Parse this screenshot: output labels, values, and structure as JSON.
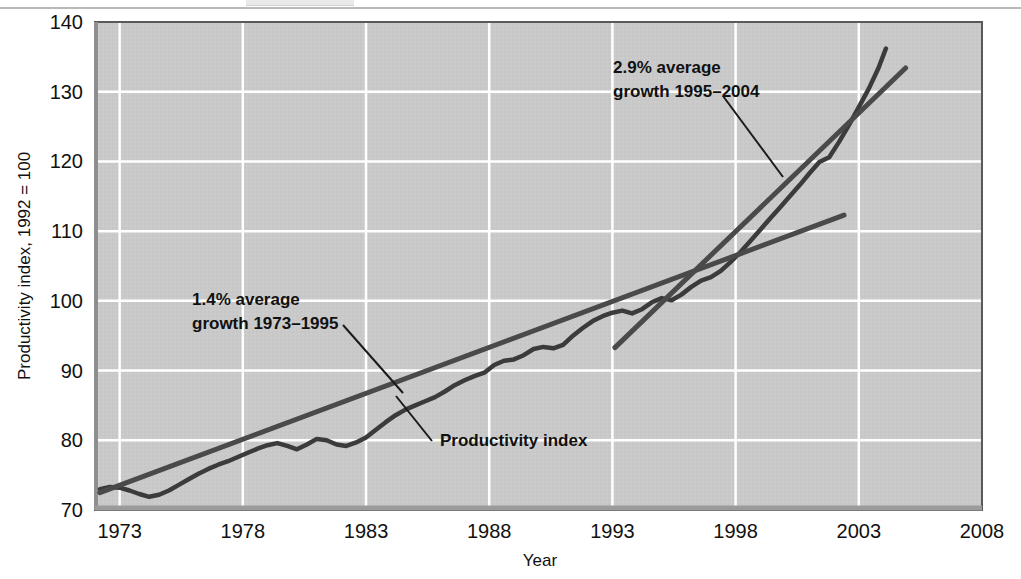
{
  "chart_data": {
    "type": "line",
    "title": "",
    "xlabel": "Year",
    "ylabel": "Productivity index, 1992 = 100",
    "xlim": [
      1972,
      2008
    ],
    "ylim": [
      70,
      140
    ],
    "xticks": [
      "1973",
      "1978",
      "1983",
      "1988",
      "1993",
      "1998",
      "2003",
      "2008"
    ],
    "xtick_values": [
      1973,
      1978,
      1983,
      1988,
      1993,
      1998,
      2003,
      2008
    ],
    "yticks": [
      "70",
      "80",
      "90",
      "100",
      "110",
      "120",
      "130",
      "140"
    ],
    "ytick_values": [
      70,
      80,
      90,
      100,
      110,
      120,
      130,
      140
    ],
    "grid": true,
    "legend_position": "none",
    "plot_bgcolor": "#c9c9c9",
    "gridcolor": "#ffffff",
    "linecolor": "#3b3b3b",
    "trendcolor": "#4a4a4a",
    "series": [
      {
        "name": "Productivity index",
        "type": "line",
        "x": [
          1972.2,
          1972.6,
          1973.0,
          1973.4,
          1973.8,
          1974.2,
          1974.6,
          1975.0,
          1975.4,
          1975.8,
          1976.2,
          1976.6,
          1977.0,
          1977.4,
          1977.8,
          1978.2,
          1978.6,
          1979.0,
          1979.4,
          1979.8,
          1980.2,
          1980.6,
          1981.0,
          1981.4,
          1981.8,
          1982.2,
          1982.6,
          1983.0,
          1983.4,
          1983.8,
          1984.2,
          1984.6,
          1985.0,
          1985.4,
          1985.8,
          1986.2,
          1986.6,
          1987.0,
          1987.4,
          1987.8,
          1988.2,
          1988.6,
          1989.0,
          1989.4,
          1989.8,
          1990.2,
          1990.6,
          1991.0,
          1991.4,
          1991.8,
          1992.2,
          1992.6,
          1993.0,
          1993.4,
          1993.8,
          1994.2,
          1994.6,
          1995.0,
          1995.4,
          1995.8,
          1996.2,
          1996.6,
          1997.0,
          1997.4,
          1997.8,
          1998.2,
          1998.6,
          1999.0,
          1999.4,
          1999.8,
          2000.2,
          2000.6,
          2001.0,
          2001.4,
          2001.8,
          2002.2,
          2002.6,
          2003.0,
          2003.4,
          2003.8,
          2004.1
        ],
        "y": [
          73.0,
          73.3,
          73.2,
          72.8,
          72.3,
          71.9,
          72.2,
          72.8,
          73.6,
          74.4,
          75.2,
          75.9,
          76.5,
          77.0,
          77.6,
          78.2,
          78.8,
          79.3,
          79.6,
          79.2,
          78.7,
          79.4,
          80.2,
          80.0,
          79.4,
          79.2,
          79.7,
          80.4,
          81.5,
          82.6,
          83.6,
          84.4,
          85.0,
          85.6,
          86.2,
          87.0,
          87.9,
          88.6,
          89.2,
          89.7,
          90.8,
          91.4,
          91.6,
          92.2,
          93.1,
          93.4,
          93.2,
          93.7,
          95.0,
          96.1,
          97.1,
          97.8,
          98.3,
          98.6,
          98.2,
          98.8,
          99.8,
          100.4,
          100.1,
          100.9,
          102.0,
          102.9,
          103.4,
          104.3,
          105.6,
          107.0,
          108.6,
          110.2,
          111.8,
          113.4,
          115.0,
          116.6,
          118.3,
          119.9,
          120.6,
          122.8,
          125.2,
          127.8,
          130.4,
          133.4,
          136.2
        ]
      },
      {
        "name": "1.4% average growth 1973-1995 trend",
        "type": "trend",
        "x": [
          1972.2,
          2002.4
        ],
        "y": [
          72.5,
          112.3
        ]
      },
      {
        "name": "2.9% average growth 1995-2004 trend",
        "type": "trend",
        "x": [
          1993.1,
          2004.9
        ],
        "y": [
          93.3,
          133.4
        ]
      }
    ],
    "annotations": [
      {
        "name": "growth-1973-1995-annotation",
        "line1": "1.4% average",
        "line2": "growth 1973–1995",
        "text_x": 192,
        "text_y": 305,
        "leader": [
          343,
          325,
          403,
          393
        ]
      },
      {
        "name": "growth-1995-2004-annotation",
        "line1": "2.9% average",
        "line2": "growth 1995–2004",
        "text_x": 613,
        "text_y": 73,
        "leader": [
          723,
          96,
          783,
          177
        ]
      },
      {
        "name": "productivity-index-annotation",
        "line1": "Productivity index",
        "line2": "",
        "text_x": 440,
        "text_y": 446,
        "leader": [
          396,
          396,
          432,
          441
        ]
      }
    ]
  }
}
